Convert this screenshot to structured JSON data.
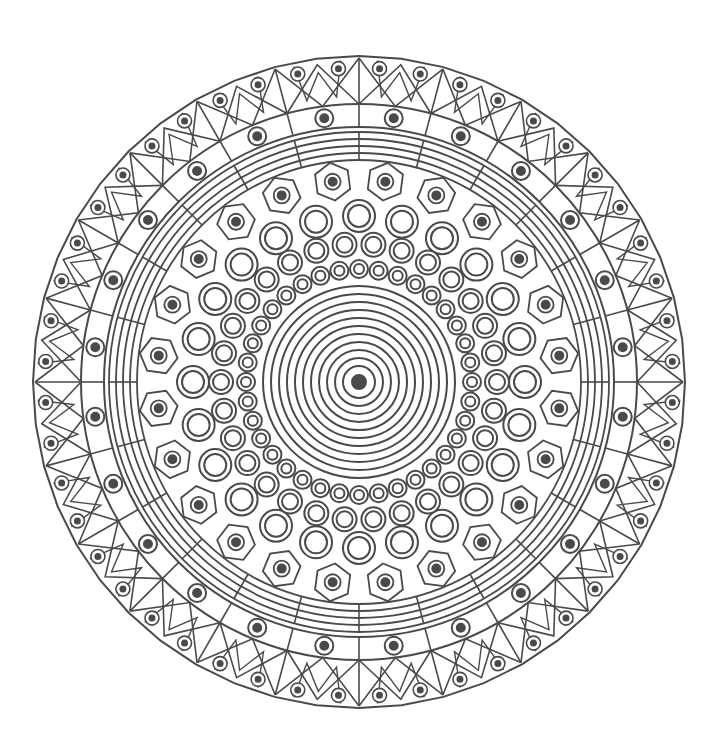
{
  "image": {
    "subject": "mandala line art",
    "background": "#ffffff",
    "stroke": "#4a4a4a",
    "center": [
      359,
      382
    ],
    "outer_radius": 326
  },
  "layers": {
    "center_dot_radius": 7,
    "concentric_rings": [
      16,
      24,
      32,
      40,
      48,
      56,
      64,
      72,
      80,
      88,
      96
    ],
    "ring_small_circles": {
      "radius": 113,
      "count": 36,
      "r_outer": 9,
      "r_inner": 5
    },
    "ring_medium_circles": {
      "radius": 138,
      "count": 30,
      "r_outer": 12,
      "r_inner": 8
    },
    "ring_large_circles": {
      "radius": 166,
      "count": 24,
      "r_outer": 16,
      "r_inner": 11
    },
    "ring_hexagons": {
      "radius": 202,
      "count": 24,
      "size": 19,
      "dot": 4,
      "inner_circle": 8
    },
    "line_band": [
      222,
      229,
      236,
      243,
      250
    ],
    "dot_ring": {
      "radius": 265,
      "inner_boundary": 255,
      "outer_boundary": 278,
      "count": 24,
      "r_outer": 9,
      "r_dot": 4
    },
    "zigzag_band": {
      "inner": 278,
      "outer": 326,
      "segments": 24,
      "dots_per_segment": 2,
      "r_outer": 7,
      "r_dot": 2.5
    }
  }
}
